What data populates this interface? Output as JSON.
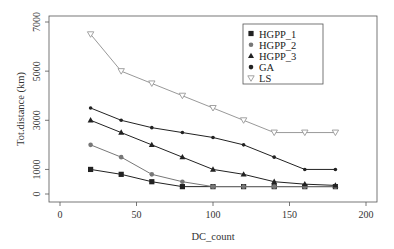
{
  "chart_data": {
    "type": "line",
    "title": "",
    "xlabel": "DC_count",
    "ylabel": "Tot.distance (km)",
    "xlim": [
      0,
      200
    ],
    "ylim": [
      0,
      7000
    ],
    "x_ticks": [
      0,
      50,
      100,
      150,
      200
    ],
    "y_ticks": [
      0,
      1000,
      3000,
      5000,
      7000
    ],
    "grid": false,
    "legend_position": "top-right",
    "x": [
      20,
      40,
      60,
      80,
      100,
      120,
      140,
      160,
      180
    ],
    "series": [
      {
        "name": "HGPP_1",
        "marker": "square",
        "color": "#222222",
        "values": [
          1000,
          800,
          500,
          300,
          300,
          300,
          300,
          300,
          300
        ]
      },
      {
        "name": "HGPP_2",
        "marker": "circle",
        "color": "#777777",
        "values": [
          2000,
          1500,
          800,
          500,
          300,
          300,
          300,
          300,
          300
        ]
      },
      {
        "name": "HGPP_3",
        "marker": "triangle",
        "color": "#222222",
        "values": [
          3000,
          2500,
          2000,
          1500,
          1000,
          800,
          500,
          400,
          350
        ]
      },
      {
        "name": "GA",
        "marker": "dot",
        "color": "#222222",
        "values": [
          3500,
          3000,
          2700,
          2500,
          2300,
          2000,
          1500,
          1000,
          1000
        ]
      },
      {
        "name": "LS",
        "marker": "triangle-down-open",
        "color": "#999999",
        "values": [
          6500,
          5000,
          4500,
          4000,
          3500,
          3000,
          2500,
          2500,
          2500
        ]
      }
    ]
  },
  "axes": {
    "x_label": "DC_count",
    "y_label": "Tot.distance (km)",
    "x_tick_labels": [
      "0",
      "50",
      "100",
      "150",
      "200"
    ],
    "y_tick_labels": [
      "0",
      "1000",
      "3000",
      "5000",
      "7000"
    ]
  },
  "legend": {
    "items": [
      {
        "label": "HGPP_1",
        "symbol": "■"
      },
      {
        "label": "HGPP_2",
        "symbol": "●"
      },
      {
        "label": "HGPP_3",
        "symbol": "▲"
      },
      {
        "label": "GA",
        "symbol": "●"
      },
      {
        "label": "LS",
        "symbol": "▽"
      }
    ]
  }
}
